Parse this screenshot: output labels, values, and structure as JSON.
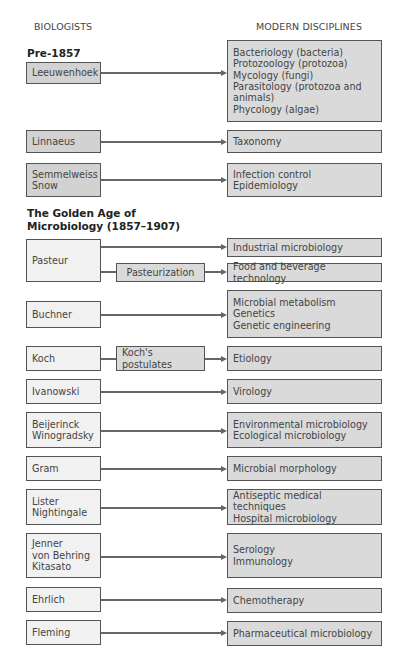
{
  "headers": {
    "left": "BIOLOGISTS",
    "right": "MODERN DISCIPLINES"
  },
  "sections": [
    {
      "title": "Pre-1857"
    },
    {
      "title": "The Golden Age of\nMicrobiology (1857–1907)"
    }
  ],
  "rows": [
    {
      "biologists": "Leeuwenhoek",
      "disciplines": "Bacteriology (bacteria)\nProtozoology (protozoa)\nMycology (fungi)\nParasitology (protozoa and\nanimals)\nPhycology (algae)"
    },
    {
      "biologists": "Linnaeus",
      "disciplines": "Taxonomy"
    },
    {
      "biologists": "Semmelweiss\nSnow",
      "disciplines": "Infection control\nEpidemiology"
    },
    {
      "biologists": "Pasteur",
      "disciplines": "Industrial microbiology",
      "intermediate": "Pasteurization",
      "disciplines2": "Food and beverage technology"
    },
    {
      "biologists": "Buchner",
      "disciplines": "Microbial metabolism\nGenetics\nGenetic engineering"
    },
    {
      "biologists": "Koch",
      "intermediate": "Koch's postulates",
      "disciplines": "Etiology"
    },
    {
      "biologists": "Ivanowski",
      "disciplines": "Virology"
    },
    {
      "biologists": "Beijerinck\nWinogradsky",
      "disciplines": "Environmental microbiology\nEcological microbiology"
    },
    {
      "biologists": "Gram",
      "disciplines": "Microbial morphology"
    },
    {
      "biologists": "Lister\nNightingale",
      "disciplines": "Antiseptic medical techniques\nHospital microbiology"
    },
    {
      "biologists": "Jenner\nvon Behring\nKitasato",
      "disciplines": "Serology\nImmunology"
    },
    {
      "biologists": "Ehrlich",
      "disciplines": "Chemotherapy"
    },
    {
      "biologists": "Fleming",
      "disciplines": "Pharmaceutical microbiology"
    }
  ],
  "colors": {
    "pre1857_fill": "#d2d2d2",
    "golden_age_fill": "#f1f1f1",
    "discipline_fill": "#dadada",
    "border": "#555555"
  }
}
